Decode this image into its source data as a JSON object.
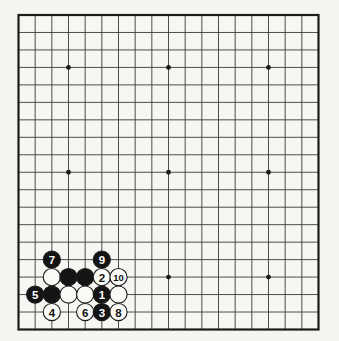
{
  "diagram": {
    "type": "go-board-diagram",
    "board_size": 19,
    "colors": {
      "page_background": "#f4f4f1",
      "board_background": "#f6f6f3",
      "grid_line": "#3a3a3a",
      "border_line": "#1c1c1c",
      "star_point": "#1a1a1a",
      "black_stone_fill": "#141414",
      "white_stone_fill": "#fafaf7",
      "stone_outline": "#1c1c1c",
      "black_stone_number": "#ffffff",
      "white_stone_number": "#111111"
    },
    "star_points": [
      {
        "col": 4,
        "row": 4
      },
      {
        "col": 10,
        "row": 4
      },
      {
        "col": 16,
        "row": 4
      },
      {
        "col": 4,
        "row": 10
      },
      {
        "col": 10,
        "row": 10
      },
      {
        "col": 16,
        "row": 10
      },
      {
        "col": 4,
        "row": 16
      },
      {
        "col": 10,
        "row": 16
      },
      {
        "col": 16,
        "row": 16
      }
    ],
    "stones": [
      {
        "col": 3,
        "row": 15,
        "color": "black",
        "number": "7"
      },
      {
        "col": 6,
        "row": 15,
        "color": "black",
        "number": "9"
      },
      {
        "col": 3,
        "row": 16,
        "color": "white",
        "number": ""
      },
      {
        "col": 4,
        "row": 16,
        "color": "black",
        "number": ""
      },
      {
        "col": 5,
        "row": 16,
        "color": "black",
        "number": ""
      },
      {
        "col": 6,
        "row": 16,
        "color": "white",
        "number": "2"
      },
      {
        "col": 7,
        "row": 16,
        "color": "white",
        "number": "10"
      },
      {
        "col": 2,
        "row": 17,
        "color": "black",
        "number": "5"
      },
      {
        "col": 3,
        "row": 17,
        "color": "black",
        "number": ""
      },
      {
        "col": 4,
        "row": 17,
        "color": "white",
        "number": ""
      },
      {
        "col": 5,
        "row": 17,
        "color": "white",
        "number": ""
      },
      {
        "col": 6,
        "row": 17,
        "color": "black",
        "number": "1"
      },
      {
        "col": 7,
        "row": 17,
        "color": "white",
        "number": ""
      },
      {
        "col": 3,
        "row": 18,
        "color": "white",
        "number": "4"
      },
      {
        "col": 5,
        "row": 18,
        "color": "white",
        "number": "6"
      },
      {
        "col": 6,
        "row": 18,
        "color": "black",
        "number": "3"
      },
      {
        "col": 7,
        "row": 18,
        "color": "white",
        "number": "8"
      }
    ]
  }
}
